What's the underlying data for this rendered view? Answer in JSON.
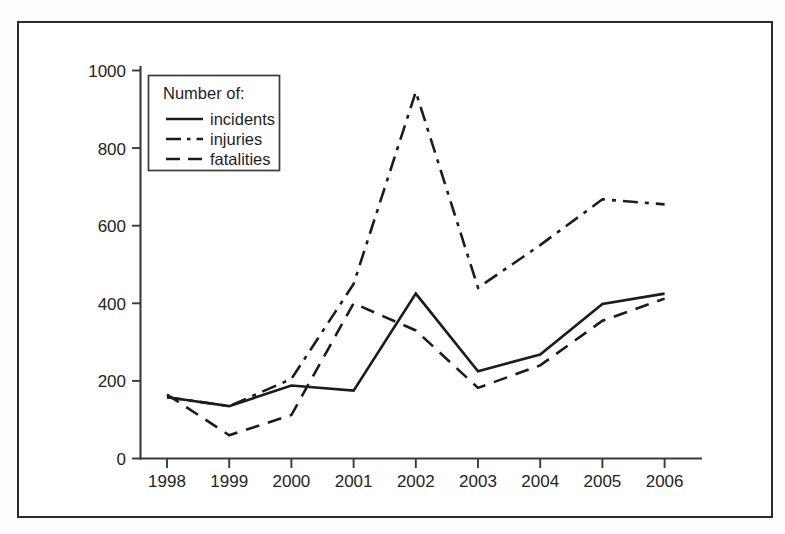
{
  "figure": {
    "frame_color": "#2b2b2b",
    "background": "#ffffff",
    "line_color": "#1c1c1c"
  },
  "legend": {
    "title": "Number of:",
    "entries": [
      {
        "label": "incidents",
        "style": "solid"
      },
      {
        "label": "injuries",
        "style": "dash-dot"
      },
      {
        "label": "fatalities",
        "style": "long-dash"
      }
    ]
  },
  "axes": {
    "y_ticks": [
      "0",
      "200",
      "400",
      "600",
      "800",
      "1000"
    ],
    "x_ticks": [
      "1998",
      "1999",
      "2000",
      "2001",
      "2002",
      "2003",
      "2004",
      "2005",
      "2006"
    ]
  },
  "chart_data": {
    "type": "line",
    "title": "",
    "subtitle": "",
    "xlabel": "",
    "ylabel": "",
    "legend_title": "Number of:",
    "legend_position": "top-left-inside",
    "grid": false,
    "xlim": [
      "1998",
      "2006"
    ],
    "ylim": [
      0,
      1000
    ],
    "y_ticks": [
      0,
      200,
      400,
      600,
      800,
      1000
    ],
    "categories": [
      "1998",
      "1999",
      "2000",
      "2001",
      "2002",
      "2003",
      "2004",
      "2005",
      "2006"
    ],
    "series": [
      {
        "name": "incidents",
        "style": "solid",
        "values": [
          158,
          135,
          188,
          175,
          425,
          225,
          268,
          398,
          425
        ]
      },
      {
        "name": "injuries",
        "style": "dash-dot",
        "values": [
          158,
          135,
          205,
          450,
          945,
          440,
          550,
          668,
          655
        ]
      },
      {
        "name": "fatalities",
        "style": "long-dash",
        "values": [
          165,
          60,
          112,
          400,
          330,
          182,
          240,
          355,
          412
        ]
      }
    ]
  }
}
